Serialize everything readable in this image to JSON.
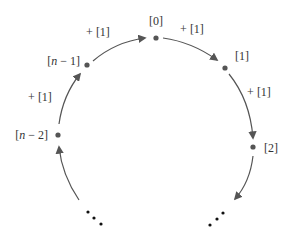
{
  "diagram": {
    "type": "circular-buffer",
    "colors": {
      "line": "#555555",
      "node": "#555555",
      "text": "#333333",
      "ellipsis": "#111111"
    },
    "nodes": [
      {
        "id": "n0",
        "label": "[0]",
        "x": 156,
        "y": 38
      },
      {
        "id": "n1",
        "label": "[1]",
        "x": 225,
        "y": 68
      },
      {
        "id": "n2",
        "label": "[2]",
        "x": 253,
        "y": 147
      },
      {
        "id": "nm1",
        "label_prefix": "[",
        "label_var": "n",
        "label_suffix": " − 1]",
        "x": 87,
        "y": 65
      },
      {
        "id": "nm2",
        "label_prefix": "[",
        "label_var": "n",
        "label_suffix": " − 2]",
        "x": 58,
        "y": 135
      }
    ],
    "edge_labels": {
      "nm1_to_n0": "+ [1]",
      "n0_to_n1": "+ [1]",
      "n1_to_n2": "+ [1]",
      "nm2_to_nm1": "+ [1]"
    },
    "ellipsis": "⋯"
  }
}
